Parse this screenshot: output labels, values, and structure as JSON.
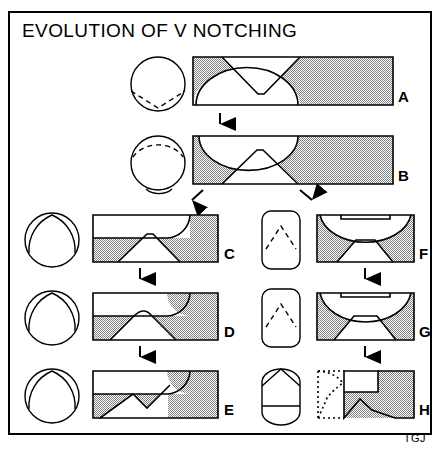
{
  "figure": {
    "title": "EVOLUTION OF V NOTCHING",
    "credit": "TGJ",
    "domain_type": "diagram",
    "diagram_type": "process-flow-illustration",
    "colors": {
      "outline": "#000000",
      "background": "#ffffff",
      "hatch_fill": "#9a9a9a",
      "frame": "#000000"
    }
  },
  "stages": [
    {
      "id": "A",
      "label": "A",
      "section_view": "circle with dashed V-shaped notch lines at lower portion",
      "profile_view": "hatched bar with V notch cut from top and dome cut from bottom",
      "flow_to": "B"
    },
    {
      "id": "B",
      "label": "B",
      "section_view": "circle with dashed dome on top and shallow concave notch at bottom",
      "profile_view": "hatched bar with dome cut from top and V notch cut from bottom",
      "flow_to": "C and F"
    },
    {
      "id": "C",
      "label": "C",
      "section_view": "circle with solid rounded-triangle inscribed",
      "profile_view": "hatched bar, stepped flat cut across top-left with curved shoulder, V notch at bottom",
      "flow_to": "D"
    },
    {
      "id": "D",
      "label": "D",
      "section_view": "circle with solid rounded-triangle inscribed",
      "profile_view": "hatched bar, stepped flat cut across top-left, widened curved V notch at bottom",
      "flow_to": "E"
    },
    {
      "id": "E",
      "label": "E",
      "section_view": "circle with solid rounded-triangle inscribed",
      "profile_view": "hatched bar, stepped flat cut across top-left, broad deep angular V notch at bottom",
      "flow_to": null
    },
    {
      "id": "F",
      "label": "F",
      "section_view": "rounded rectangle with dashed peak lines",
      "profile_view": "hatched bar with large bowl cut from top and V notch at bottom",
      "flow_to": "G"
    },
    {
      "id": "G",
      "label": "G",
      "section_view": "rounded rectangle with dashed peak lines",
      "profile_view": "hatched bar with deeper bowl cut from top and wide V notch at bottom",
      "flow_to": "H"
    },
    {
      "id": "H",
      "label": "H",
      "section_view": "rounded pill shape with solid peak at top",
      "profile_view": "hatched bar with dotted outline at left showing removed material, stepped cut and angular notch",
      "flow_to": null
    }
  ],
  "flow_arrows": [
    {
      "from": "A",
      "to": "B",
      "direction": "down"
    },
    {
      "from": "B",
      "to": "C",
      "direction": "down-left"
    },
    {
      "from": "B",
      "to": "F",
      "direction": "down-right"
    },
    {
      "from": "C",
      "to": "D",
      "direction": "down"
    },
    {
      "from": "D",
      "to": "E",
      "direction": "down"
    },
    {
      "from": "F",
      "to": "G",
      "direction": "down"
    },
    {
      "from": "G",
      "to": "H",
      "direction": "down"
    }
  ]
}
